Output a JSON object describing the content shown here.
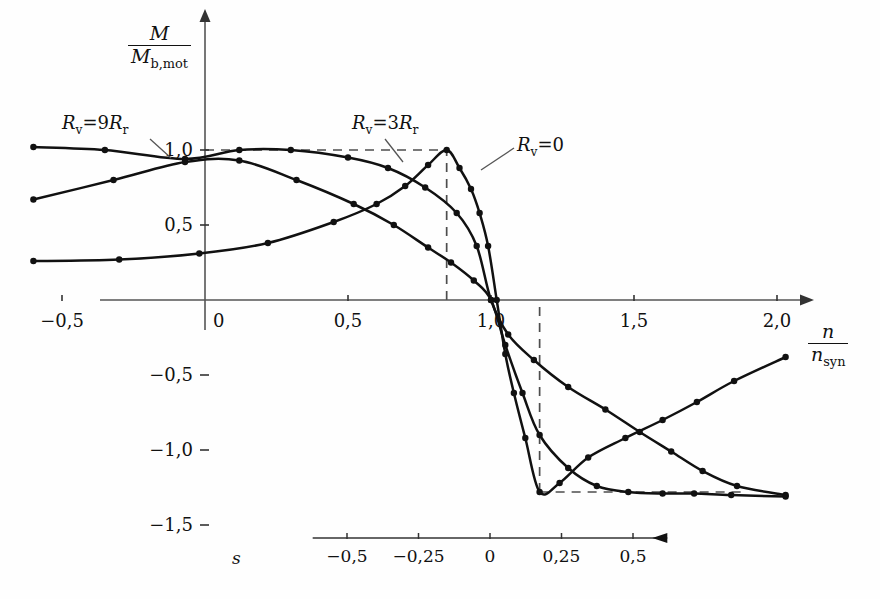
{
  "chart_data": {
    "type": "line",
    "title": "",
    "subtitle": "",
    "xlabel": "n / n_syn",
    "ylabel": "M / M_b,mot",
    "xlim": [
      -0.62,
      2.12
    ],
    "ylim": [
      -1.62,
      1.22
    ],
    "xticks": [
      -0.5,
      0,
      0.5,
      1.0,
      1.5,
      2.0
    ],
    "xticklabels": [
      "−0,5",
      "0",
      "0,5",
      "1,0",
      "1,5",
      "2,0"
    ],
    "yticks": [
      1.0,
      0.5,
      -0.5,
      -1.0,
      -1.5
    ],
    "yticklabels": [
      "1,0",
      "0,5",
      "−0,5",
      "−1,0",
      "−1,5"
    ],
    "grid": false,
    "legend_position": "inline-annotations",
    "secondary_axis": {
      "name": "s",
      "direction": "right-to-left",
      "ticks": [
        0.5,
        0.25,
        0,
        -0.25,
        -0.5
      ],
      "ticklabels": [
        "0,5",
        "0,25",
        "0",
        "−0,25",
        "−0,5"
      ],
      "arrow": "left"
    },
    "annotations": [
      {
        "text": "R_v = 9R_r",
        "x": -0.28,
        "y": 1.13
      },
      {
        "text": "R_v = 3R_r",
        "x": 0.75,
        "y": 1.13
      },
      {
        "text": "R_v = 0",
        "x": 1.27,
        "y": 1.03
      }
    ],
    "guides": [
      {
        "type": "hline",
        "y": 1.0,
        "x_from": 0.0,
        "x_to": 0.845,
        "style": "dashed"
      },
      {
        "type": "vline",
        "x": 0.845,
        "y_from": 0.0,
        "y_to": 1.0,
        "style": "dashed"
      },
      {
        "type": "vline",
        "x": 1.17,
        "y_from": -1.28,
        "y_to": 0.0,
        "style": "dashed"
      },
      {
        "type": "hline",
        "y": -1.28,
        "x_from": 1.17,
        "x_to": 1.88,
        "style": "dashed"
      }
    ],
    "series": [
      {
        "name": "R_v = 9R_r",
        "label": "R_v = 9R_r",
        "color": "#111111",
        "marker": "dot",
        "x": [
          -0.6,
          -0.35,
          -0.07,
          0.12,
          0.3,
          0.5,
          0.64,
          0.77,
          0.88,
          0.95,
          1.0,
          1.06,
          1.15,
          1.27,
          1.4,
          1.52,
          1.63,
          1.74,
          1.86,
          2.03
        ],
        "y": [
          1.02,
          1.0,
          0.94,
          1.0,
          1.0,
          0.95,
          0.88,
          0.75,
          0.58,
          0.36,
          0.0,
          -0.23,
          -0.4,
          -0.58,
          -0.73,
          -0.88,
          -1.01,
          -1.14,
          -1.24,
          -1.3
        ]
      },
      {
        "name": "R_v = 3R_r",
        "label": "R_v = 3R_r",
        "color": "#111111",
        "marker": "dot",
        "x": [
          -0.6,
          -0.32,
          -0.07,
          0.12,
          0.32,
          0.52,
          0.66,
          0.78,
          0.86,
          0.94,
          1.0,
          1.05,
          1.11,
          1.17,
          1.27,
          1.37,
          1.48,
          1.6,
          1.71,
          1.84,
          2.03
        ],
        "y": [
          0.67,
          0.8,
          0.92,
          0.93,
          0.8,
          0.64,
          0.5,
          0.35,
          0.25,
          0.13,
          0.0,
          -0.3,
          -0.62,
          -0.9,
          -1.12,
          -1.24,
          -1.28,
          -1.29,
          -1.29,
          -1.3,
          -1.31
        ]
      },
      {
        "name": "R_v = 0",
        "label": "R_v = 0",
        "color": "#111111",
        "marker": "dot",
        "x": [
          -0.6,
          -0.3,
          -0.02,
          0.22,
          0.45,
          0.6,
          0.7,
          0.78,
          0.845,
          0.89,
          0.93,
          0.96,
          0.99,
          1.02,
          1.05,
          1.08,
          1.12,
          1.17,
          1.24,
          1.34,
          1.47,
          1.6,
          1.72,
          1.85,
          2.03
        ],
        "y": [
          0.26,
          0.27,
          0.31,
          0.38,
          0.52,
          0.64,
          0.76,
          0.9,
          1.0,
          0.88,
          0.74,
          0.58,
          0.36,
          0.0,
          -0.36,
          -0.62,
          -0.92,
          -1.28,
          -1.22,
          -1.05,
          -0.92,
          -0.8,
          -0.68,
          -0.54,
          -0.38
        ]
      }
    ]
  },
  "axis_labels": {
    "y_numerator": "M",
    "y_denominator_main": "M",
    "y_denominator_sub": "b,mot",
    "x_numerator": "n",
    "x_denominator_main": "n",
    "x_denominator_sub": "syn",
    "slip_symbol": "s"
  },
  "series_annotations": {
    "s1_r": "R",
    "s1_rsub": "v",
    "s1_eq": "=9",
    "s1_r2": "R",
    "s1_r2sub": "r",
    "s2_r": "R",
    "s2_rsub": "v",
    "s2_eq": "=3",
    "s2_r2": "R",
    "s2_r2sub": "r",
    "s3_r": "R",
    "s3_rsub": "v",
    "s3_eq": "=0"
  }
}
